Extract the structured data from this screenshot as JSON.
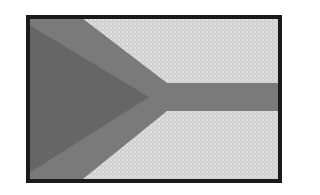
{
  "image": {
    "subject": "grayscale flag with Y-shaped band and triangle at hoist",
    "colors": {
      "border": "#1a1a1a",
      "field": "#d4d4d4",
      "band": "#7a7a7a",
      "triangle": "#666666"
    }
  }
}
